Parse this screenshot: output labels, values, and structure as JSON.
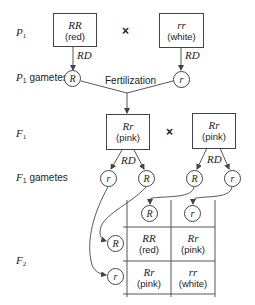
{
  "generations": {
    "p1": {
      "label": "P",
      "sub": "1"
    },
    "p1_gametes": {
      "label": "P",
      "sub": "1",
      "suffix": " gametes"
    },
    "f1": {
      "label": "F",
      "sub": "1"
    },
    "f1_gametes": {
      "label": "F",
      "sub": "1",
      "suffix": " gametes"
    },
    "f2": {
      "label": "F",
      "sub": "2"
    }
  },
  "p1": {
    "parent1": {
      "genotype": "RR",
      "phenotype": "(red)"
    },
    "parent2": {
      "genotype": "rr",
      "phenotype": "(white)"
    },
    "cross_symbol": "×",
    "division_label": "RD",
    "gametes": [
      "R",
      "r"
    ],
    "fertilization_label": "Fertilization"
  },
  "f1": {
    "parent1": {
      "genotype": "Rr",
      "phenotype": "(pink)"
    },
    "parent2": {
      "genotype": "Rr",
      "phenotype": "(pink)"
    },
    "cross_symbol": "×",
    "division_label": "RD",
    "gametes": [
      "r",
      "R",
      "R",
      "r"
    ]
  },
  "punnett": {
    "column_gametes": [
      "R",
      "r"
    ],
    "row_gametes": [
      "R",
      "r"
    ],
    "cells": [
      [
        {
          "genotype": "RR",
          "phenotype": "(red)"
        },
        {
          "genotype": "Rr",
          "phenotype": "(pink)"
        }
      ],
      [
        {
          "genotype": "Rr",
          "phenotype": "(pink)"
        },
        {
          "genotype": "rr",
          "phenotype": "(white)"
        }
      ]
    ]
  },
  "colors": {
    "line": "#444444",
    "text": "#222222",
    "background": "#ffffff"
  }
}
